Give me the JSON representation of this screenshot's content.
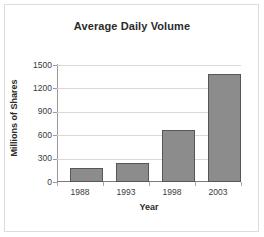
{
  "chart_data": {
    "type": "bar",
    "title": "Average Daily Volume",
    "xlabel": "Year",
    "ylabel": "Millions of Shares",
    "categories": [
      "1988",
      "1993",
      "1998",
      "2003"
    ],
    "values": [
      180,
      250,
      670,
      1390
    ],
    "ylim": [
      0,
      1500
    ],
    "yticks": [
      0,
      300,
      600,
      900,
      1200,
      1500
    ],
    "ytick_labels": [
      "0",
      "300",
      "600",
      "900",
      "1200",
      "1500"
    ],
    "grid": true,
    "legend": "none",
    "series": [
      {
        "name": "Average Daily Volume",
        "values": [
          180,
          250,
          670,
          1390
        ],
        "color": "#8c8c8c",
        "border_color": "#565656"
      }
    ],
    "colors": {
      "bar_fill": "#8c8c8c",
      "bar_border": "#565656",
      "gridline": "#d9d9d9",
      "axis": "#9a9a9a",
      "text": "#2b2b2b",
      "background": "#ffffff",
      "frame_border": "#dcdcdc"
    }
  }
}
